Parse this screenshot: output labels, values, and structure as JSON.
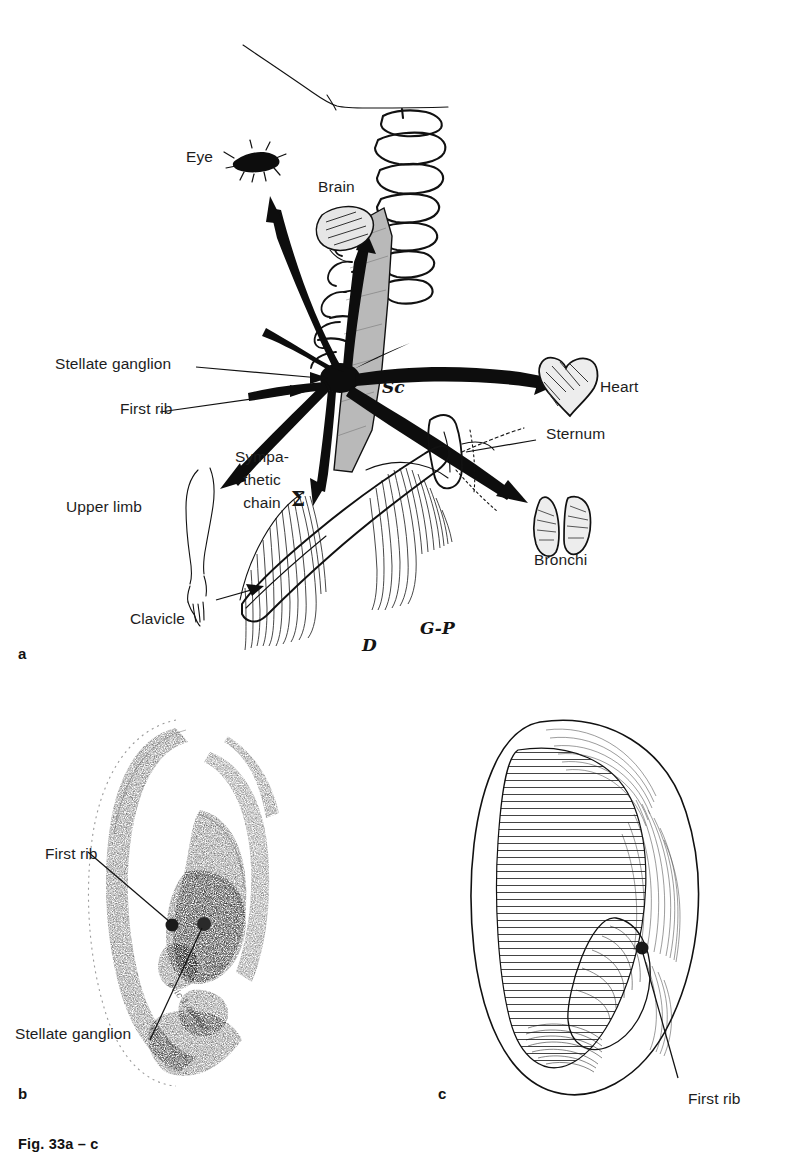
{
  "figure": {
    "caption": "Fig. 33a – c",
    "panels": [
      {
        "letter": "a",
        "name": "stellate-ganglion-projections"
      },
      {
        "letter": "b",
        "name": "ear-stippled-first-rib-stellate"
      },
      {
        "letter": "c",
        "name": "ear-line-first-rib"
      }
    ]
  },
  "panel_a": {
    "letter": "a",
    "labels": {
      "eye": "Eye",
      "brain": "Brain",
      "stellate_ganglion": "Stellate ganglion",
      "first_rib": "First rib",
      "sympathetic_chain_line1": "Sympa-",
      "sympathetic_chain_line2": "thetic",
      "sympathetic_chain_line3": "chain",
      "upper_limb": "Upper limb",
      "clavicle": "Clavicle",
      "heart": "Heart",
      "sternum": "Sternum",
      "bronchi": "Bronchi"
    },
    "handwritten": {
      "sc": "Sc",
      "sigma": "Σ",
      "deltoid": "D",
      "pectoralis": "G-P"
    }
  },
  "panel_b": {
    "letter": "b",
    "labels": {
      "first_rib": "First rib",
      "stellate_ganglion": "Stellate ganglion"
    },
    "points": [
      "first-rib-point",
      "stellate-ganglion-point"
    ]
  },
  "panel_c": {
    "letter": "c",
    "labels": {
      "first_rib": "First rib"
    },
    "points": [
      "first-rib-point"
    ]
  },
  "colors": {
    "ink": "#111111",
    "paper": "#ffffff",
    "gray_fill": "#b9b9b9"
  }
}
